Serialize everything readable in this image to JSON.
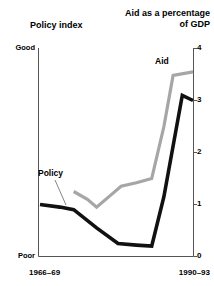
{
  "titles": {
    "left": "Policy index",
    "right_line1": "Aid as a percentage",
    "right_line2": "of GDP"
  },
  "axes": {
    "left_top_label": "Good",
    "left_bottom_label": "Poor",
    "x_start": "1966–69",
    "x_end": "1990–93",
    "right_ticks": [
      "4",
      "3",
      "2",
      "1",
      "0"
    ]
  },
  "series_labels": {
    "policy": "Policy",
    "aid": "Aid"
  },
  "colors": {
    "policy_line": "#111111",
    "aid_line": "#a6a6a6",
    "axis": "#555555",
    "background": "#ffffff",
    "text": "#000000"
  },
  "chart_data": {
    "type": "line",
    "xlabel": "",
    "ylabel": "Aid as a percentage of GDP",
    "y2label": "Policy index",
    "ylim": [
      0,
      4
    ],
    "yticks": [
      0,
      1,
      2,
      3,
      4
    ],
    "grid": false,
    "legend": "inline-annotations",
    "x_tick_labels": [
      "1966–69",
      "1990–93"
    ],
    "x_range_label": "1966–69 to 1990–93",
    "left_axis_qualitative": [
      "Poor",
      "Good"
    ],
    "series": [
      {
        "name": "Policy",
        "color": "#111111",
        "axis": "left-qualitative",
        "x": [
          0.0,
          0.13,
          0.22,
          0.37,
          0.51,
          0.63,
          0.73,
          0.81,
          0.93,
          1.0
        ],
        "values": [
          1.0,
          0.95,
          0.9,
          0.55,
          0.25,
          0.22,
          0.2,
          1.15,
          3.1,
          3.0
        ]
      },
      {
        "name": "Aid",
        "color": "#a6a6a6",
        "axis": "right",
        "x": [
          0.22,
          0.31,
          0.37,
          0.47,
          0.53,
          0.63,
          0.73,
          0.81,
          0.87,
          1.0
        ],
        "values": [
          1.25,
          1.1,
          0.95,
          1.2,
          1.35,
          1.42,
          1.5,
          2.5,
          3.48,
          3.55
        ]
      }
    ]
  }
}
